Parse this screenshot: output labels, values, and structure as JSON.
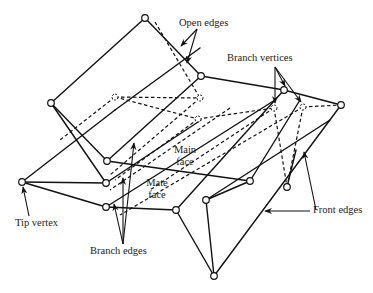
{
  "diagram": {
    "colors": {
      "stroke": "#111111",
      "background": "#ffffff",
      "text": "#222222"
    },
    "labels": {
      "open_edges": "Open edges",
      "branch_vertices": "Branch vertices",
      "main_face_1": "Main",
      "main_face_2": "face",
      "mate_face_1": "Mate",
      "mate_face_2": "face",
      "tip_vertex": "Tip vertex",
      "branch_edges": "Branch edges",
      "front_edges": "Front edges"
    },
    "vertices": [
      {
        "id": "A",
        "x": 145,
        "y": 18,
        "hidden": false
      },
      {
        "id": "B",
        "x": 51,
        "y": 103,
        "hidden": false
      },
      {
        "id": "C",
        "x": 201,
        "y": 76,
        "hidden": false
      },
      {
        "id": "D",
        "x": 284,
        "y": 90,
        "hidden": false
      },
      {
        "id": "E",
        "x": 341,
        "y": 105,
        "hidden": false
      },
      {
        "id": "F",
        "x": 115,
        "y": 97,
        "hidden": true
      },
      {
        "id": "G",
        "x": 200,
        "y": 98,
        "hidden": true
      },
      {
        "id": "H",
        "x": 198,
        "y": 119,
        "hidden": true
      },
      {
        "id": "I",
        "x": 274,
        "y": 108,
        "hidden": true
      },
      {
        "id": "J",
        "x": 303,
        "y": 107,
        "hidden": true
      },
      {
        "id": "K",
        "x": 22,
        "y": 182,
        "hidden": false
      },
      {
        "id": "L",
        "x": 107,
        "y": 161,
        "hidden": false
      },
      {
        "id": "M",
        "x": 106,
        "y": 183,
        "hidden": false
      },
      {
        "id": "N",
        "x": 106,
        "y": 207,
        "hidden": false
      },
      {
        "id": "O",
        "x": 176,
        "y": 210,
        "hidden": false
      },
      {
        "id": "P",
        "x": 250,
        "y": 181,
        "hidden": false
      },
      {
        "id": "Q",
        "x": 276,
        "y": 149,
        "hidden": false
      },
      {
        "id": "R",
        "x": 206,
        "y": 200,
        "hidden": false
      },
      {
        "id": "S",
        "x": 287,
        "y": 187,
        "hidden": false
      },
      {
        "id": "T",
        "x": 214,
        "y": 276,
        "hidden": false
      }
    ]
  }
}
